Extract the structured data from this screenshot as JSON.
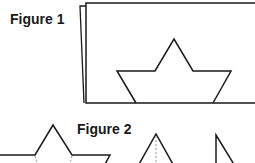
{
  "figures": [
    {
      "label": "Figure 1",
      "description": "A rectangular sheet of paper with a boat/star shape drawn on it; a second sheet slightly offset behind it"
    },
    {
      "label": "Figure 2",
      "description": "Cut-out shapes: a star-like shape with dashed fold lines, a triangle with a dashed vertical fold line, and a right-triangle shape"
    }
  ],
  "colors": {
    "stroke": "#1a1a1a",
    "dashed": "#999999",
    "background": "#ffffff"
  }
}
